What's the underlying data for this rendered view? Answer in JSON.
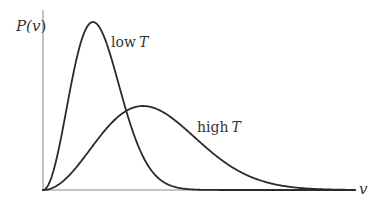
{
  "chart_data": {
    "type": "line",
    "title": "",
    "xlabel": "v",
    "ylabel": "P(v)",
    "grid": false,
    "legend": "inline labels",
    "x_range": [
      0,
      6.2
    ],
    "y_range": [
      0,
      1.0
    ],
    "series": [
      {
        "name": "low T",
        "label_text": "low",
        "label_var": "T",
        "peak_v": 1.0,
        "peak_height": 1.0,
        "form": "maxwell-boltzmann"
      },
      {
        "name": "high T",
        "label_text": "high",
        "label_var": "T",
        "peak_v": 2.0,
        "peak_height": 0.5,
        "form": "maxwell-boltzmann"
      }
    ]
  },
  "labels": {
    "y_axis_main": "P(",
    "y_axis_var": "v",
    "y_axis_close": ")",
    "x_axis": "v",
    "low_word": "low",
    "low_var": "T",
    "high_word": "high",
    "high_var": "T"
  },
  "colors": {
    "curve": "#2a2a2a",
    "axis": "#8a8a8a",
    "text": "#333333",
    "background": "#ffffff"
  }
}
